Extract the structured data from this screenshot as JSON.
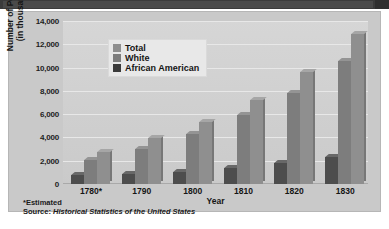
{
  "chart_data": {
    "type": "bar",
    "title": "",
    "xlabel": "Year",
    "ylabel": "Number of Persons\n(in thousands)",
    "categories": [
      "1780*",
      "1790",
      "1800",
      "1810",
      "1820",
      "1830"
    ],
    "series": [
      {
        "name": "African American",
        "color": "#4d4d4d",
        "values": [
          750,
          850,
          1000,
          1375,
          1775,
          2330
        ]
      },
      {
        "name": "White",
        "color": "#7d7d7d",
        "values": [
          2100,
          3000,
          4300,
          5900,
          7850,
          10530
        ]
      },
      {
        "name": "Total",
        "color": "#8f8f8f",
        "values": [
          2780,
          3930,
          5300,
          7240,
          9640,
          12860
        ]
      }
    ],
    "ylim": [
      0,
      14000
    ],
    "ytick_labels": [
      "14,000",
      "12,000",
      "10,000",
      "8,000",
      "6,000",
      "4,000",
      "2,000",
      "0"
    ],
    "ytick_values": [
      14000,
      12000,
      10000,
      8000,
      6000,
      4000,
      2000,
      0
    ],
    "grid": true,
    "legend_position": "top-left",
    "legend": [
      "Total",
      "White",
      "African American"
    ]
  },
  "axes": {
    "y_title_line1": "Number of Persons",
    "y_title_line2": "(in thousands)",
    "x_title": "Year"
  },
  "legend": {
    "items": [
      {
        "label": "Total",
        "swatch": "tot"
      },
      {
        "label": "White",
        "swatch": "wh"
      },
      {
        "label": "African American",
        "swatch": "aa"
      }
    ]
  },
  "notes": {
    "estimated": "*Estimated",
    "source_lead": "Source: ",
    "source_title": "Historical Statistics of the United States"
  }
}
